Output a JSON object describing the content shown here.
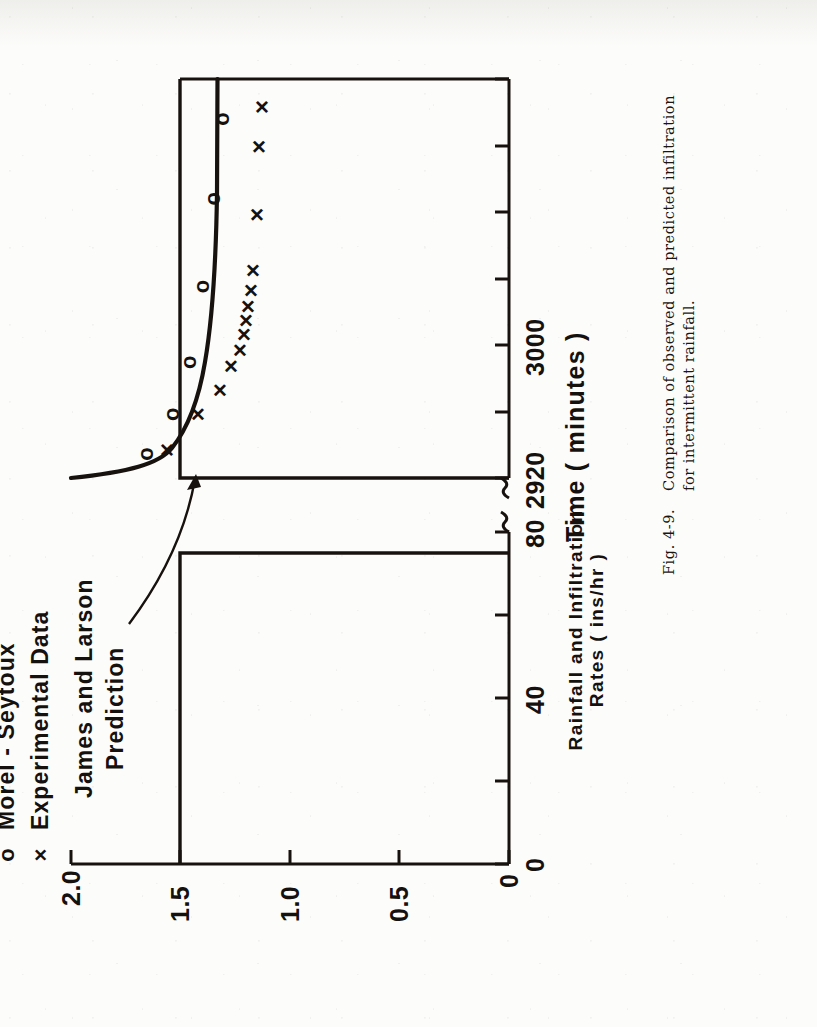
{
  "caption": {
    "figure_tag": "Fig. 4-9.",
    "lines": [
      "Comparison of observed and predicted infiltration",
      "for intermittent rainfall."
    ]
  },
  "legend": {
    "items": [
      {
        "symbol": "o",
        "label": "Morel - Seytoux"
      },
      {
        "symbol": "×",
        "label": "Experimental Data"
      }
    ]
  },
  "annotation": {
    "lines": [
      "James and Larson",
      "Prediction"
    ]
  },
  "chart_data": {
    "type": "scatter",
    "title": "",
    "xlabel": "Time ( minutes )",
    "ylabel_lines": [
      "Rainfall and Infiltration",
      "Rates ( ins/hr )"
    ],
    "ylabel": "Rainfall and Infiltration Rates ( ins/hr )",
    "grid": false,
    "axis_break": true,
    "legend_position": "upper-left-outside",
    "ylim": [
      0,
      2.0
    ],
    "yticks": [
      0,
      0.5,
      1.0,
      1.5,
      2.0
    ],
    "ytick_labels": [
      "0",
      "0.5",
      "1.0",
      "1.5",
      "2.0"
    ],
    "x_segments": [
      {
        "name": "first-storm",
        "xlim": [
          0,
          95
        ],
        "ticks": [
          0,
          20,
          40,
          60,
          80
        ],
        "tick_labels": [
          "0",
          "",
          "40",
          "",
          "80"
        ]
      },
      {
        "name": "second-storm",
        "xlim": [
          2920,
          3120
        ],
        "ticks": [
          2920,
          2960,
          3000,
          3040,
          3080,
          3120
        ],
        "tick_labels": [
          "2920",
          "",
          "3000",
          "",
          "",
          ""
        ]
      }
    ],
    "rainfall_blocks": [
      {
        "segment": "first-storm",
        "x_start": 0,
        "x_end": 75,
        "rate": 1.5
      },
      {
        "segment": "second-storm",
        "x_start": 2920,
        "x_end": 3120,
        "rate": 1.5
      }
    ],
    "series": [
      {
        "name": "James and Larson Prediction",
        "type": "line",
        "points": [
          {
            "x": 2920,
            "y": 2.0
          },
          {
            "x": 2924,
            "y": 1.84
          },
          {
            "x": 2930,
            "y": 1.73
          },
          {
            "x": 2938,
            "y": 1.66
          },
          {
            "x": 2950,
            "y": 1.6
          },
          {
            "x": 2965,
            "y": 1.56
          },
          {
            "x": 2985,
            "y": 1.53
          },
          {
            "x": 3010,
            "y": 1.51
          },
          {
            "x": 3040,
            "y": 1.5
          },
          {
            "x": 3080,
            "y": 1.5
          },
          {
            "x": 3120,
            "y": 1.5
          }
        ]
      },
      {
        "name": "Morel - Seytoux",
        "type": "scatter",
        "marker": "o",
        "points": [
          {
            "x": 2932,
            "y": 1.66
          },
          {
            "x": 2952,
            "y": 1.54
          },
          {
            "x": 2978,
            "y": 1.46
          },
          {
            "x": 3016,
            "y": 1.4
          },
          {
            "x": 3060,
            "y": 1.35
          },
          {
            "x": 3100,
            "y": 1.31
          }
        ]
      },
      {
        "name": "Experimental Data",
        "type": "scatter",
        "marker": "×",
        "points": [
          {
            "x": 2934,
            "y": 1.56
          },
          {
            "x": 2952,
            "y": 1.42
          },
          {
            "x": 2964,
            "y": 1.32
          },
          {
            "x": 2976,
            "y": 1.27
          },
          {
            "x": 2984,
            "y": 1.23
          },
          {
            "x": 2992,
            "y": 1.21
          },
          {
            "x": 2999,
            "y": 1.2
          },
          {
            "x": 3006,
            "y": 1.19
          },
          {
            "x": 3014,
            "y": 1.18
          },
          {
            "x": 3024,
            "y": 1.17
          },
          {
            "x": 3052,
            "y": 1.15
          },
          {
            "x": 3086,
            "y": 1.14
          },
          {
            "x": 3106,
            "y": 1.13
          }
        ]
      }
    ]
  }
}
